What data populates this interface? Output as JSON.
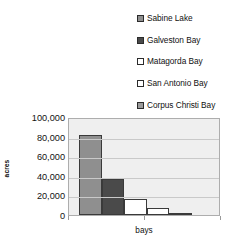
{
  "chart_data": {
    "type": "bar",
    "title": "",
    "xlabel": "bays",
    "ylabel": "acres",
    "categories": [
      "Sabine Lake",
      "Galveston Bay",
      "Matagorda Bay",
      "San Antonio Bay",
      "Corpus Christi Bay"
    ],
    "values": [
      82000,
      37000,
      16000,
      7000,
      2000
    ],
    "ylim": [
      0,
      100000
    ],
    "ytick_labels": [
      "100,000",
      "80,000",
      "60,000",
      "40,000",
      "20,000",
      "0"
    ],
    "ytick_values": [
      100000,
      80000,
      60000,
      40000,
      20000,
      0
    ],
    "xtick_labels": [
      "bays"
    ],
    "grid": true,
    "legend_position": "top-right",
    "colors": [
      "#8f8f8f",
      "#4a4a4a",
      "#ffffff",
      "#ffffff",
      "#9b9b9b"
    ],
    "plot_background": "#efefef",
    "bar_border_color": "#3a3a3a"
  },
  "legend": {
    "items": [
      {
        "label": "Sabine Lake",
        "swatch_color": "#8f8f8f",
        "swatch_name": "legend-swatch-sabine-lake"
      },
      {
        "label": "Galveston Bay",
        "swatch_color": "#4a4a4a",
        "swatch_name": "legend-swatch-galveston-bay"
      },
      {
        "label": "Matagorda Bay",
        "swatch_color": "#ffffff",
        "swatch_name": "legend-swatch-matagorda-bay"
      },
      {
        "label": "San Antonio Bay",
        "swatch_color": "#ffffff",
        "swatch_name": "legend-swatch-san-antonio-bay"
      },
      {
        "label": "Corpus Christi Bay",
        "swatch_color": "#9b9b9b",
        "swatch_name": "legend-swatch-corpus-christi-bay"
      }
    ]
  }
}
